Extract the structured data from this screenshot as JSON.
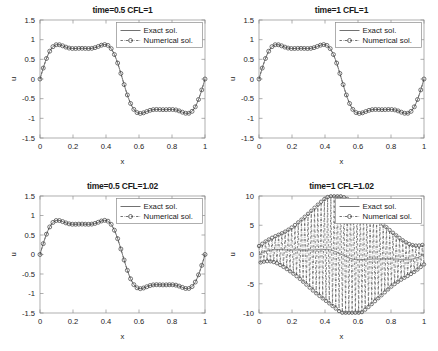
{
  "figure": {
    "background": "#ffffff",
    "axis_color": "#8c8c8c",
    "line_color": "#4d4d4d",
    "marker_color": "#3d3d3d",
    "text_color": "#1a1a1a",
    "rows": 2,
    "cols": 2
  },
  "legend": {
    "exact_label": "Exact sol.",
    "numerical_label": "Numerical sol.",
    "position": "top-right"
  },
  "chart_data": [
    {
      "id": "subplot-1",
      "type": "line",
      "title": "time=0.5 CFL=1",
      "xlabel": "x",
      "ylabel": "u",
      "xlim": [
        0,
        1
      ],
      "ylim": [
        -1.5,
        1.5
      ],
      "xticks": [
        0,
        0.2,
        0.4,
        0.6,
        0.8,
        1
      ],
      "xticklabels": [
        "0",
        "0.2",
        "0.4",
        "0.6",
        "0.8",
        "1"
      ],
      "yticks": [
        -1.5,
        -1,
        -0.5,
        0,
        0.5,
        1,
        1.5
      ],
      "yticklabels": [
        "-1.5",
        "-1",
        "-0.5",
        "0",
        "0.5",
        "1",
        "1.5"
      ],
      "grid": false,
      "waveform": {
        "formula": "sin(2*pi*x) + 0.3*sin(6*pi*x) + 0.08*sin(10*pi*x)",
        "amp1": 1.0,
        "freq1": 2,
        "amp2": 0.3,
        "freq2": 6,
        "amp3": 0.08,
        "freq3": 10,
        "phase": 0.0
      },
      "series": [
        {
          "name": "Exact sol.",
          "style": "solid",
          "marker": "none",
          "samples": 400
        },
        {
          "name": "Numerical sol.",
          "style": "dashdot",
          "marker": "circle",
          "samples": 51
        }
      ],
      "peak_value": 1.25,
      "trough_value": -1.25,
      "peak_x": 0.25,
      "trough_x": 0.75
    },
    {
      "id": "subplot-2",
      "type": "line",
      "title": "time=1 CFL=1",
      "xlabel": "x",
      "ylabel": "u",
      "xlim": [
        0,
        1
      ],
      "ylim": [
        -1.5,
        1.5
      ],
      "xticks": [
        0,
        0.2,
        0.4,
        0.6,
        0.8,
        1
      ],
      "xticklabels": [
        "0",
        "0.2",
        "0.4",
        "0.6",
        "0.8",
        "1"
      ],
      "yticks": [
        -1.5,
        -1,
        -0.5,
        0,
        0.5,
        1,
        1.5
      ],
      "yticklabels": [
        "-1.5",
        "-1",
        "-0.5",
        "0",
        "0.5",
        "1",
        "1.5"
      ],
      "grid": false,
      "waveform": {
        "formula": "sin(2*pi*x) + 0.3*sin(6*pi*x) + 0.08*sin(10*pi*x)",
        "amp1": 1.0,
        "freq1": 2,
        "amp2": 0.3,
        "freq2": 6,
        "amp3": 0.08,
        "freq3": 10,
        "phase": 0.0
      },
      "series": [
        {
          "name": "Exact sol.",
          "style": "solid",
          "marker": "none",
          "samples": 400
        },
        {
          "name": "Numerical sol.",
          "style": "dashdot",
          "marker": "circle",
          "samples": 51
        }
      ],
      "peak_value": 1.24,
      "trough_value": -1.24,
      "peak_x": 0.25,
      "trough_x": 0.75
    },
    {
      "id": "subplot-3",
      "type": "line",
      "title": "time=0.5 CFL=1.02",
      "xlabel": "x",
      "ylabel": "u",
      "xlim": [
        0,
        1
      ],
      "ylim": [
        -1.5,
        1.5
      ],
      "xticks": [
        0,
        0.2,
        0.4,
        0.6,
        0.8,
        1
      ],
      "xticklabels": [
        "0",
        "0.2",
        "0.4",
        "0.6",
        "0.8",
        "1"
      ],
      "yticks": [
        -1.5,
        -1,
        -0.5,
        0,
        0.5,
        1,
        1.5
      ],
      "yticklabels": [
        "-1.5",
        "-1",
        "-0.5",
        "0",
        "0.5",
        "1",
        "1.5"
      ],
      "grid": false,
      "waveform": {
        "formula": "sin(2*pi*x) + 0.3*sin(6*pi*x) + 0.08*sin(10*pi*x)",
        "amp1": 1.0,
        "freq1": 2,
        "amp2": 0.3,
        "freq2": 6,
        "amp3": 0.08,
        "freq3": 10,
        "phase": 0.0
      },
      "series": [
        {
          "name": "Exact sol.",
          "style": "solid",
          "marker": "none",
          "samples": 400
        },
        {
          "name": "Numerical sol.",
          "style": "dashdot",
          "marker": "circle",
          "samples": 51
        }
      ],
      "peak_value": 1.24,
      "trough_value": -1.26,
      "peak_x": 0.25,
      "trough_x": 0.75
    },
    {
      "id": "subplot-4",
      "type": "line",
      "title": "time=1 CFL=1.02",
      "xlabel": "x",
      "ylabel": "u",
      "xlim": [
        0,
        1
      ],
      "ylim": [
        -10,
        10
      ],
      "xticks": [
        0,
        0.2,
        0.4,
        0.6,
        0.8,
        1
      ],
      "xticklabels": [
        "0",
        "0.2",
        "0.4",
        "0.6",
        "0.8",
        "1"
      ],
      "yticks": [
        -10,
        -5,
        0,
        5,
        10
      ],
      "yticklabels": [
        "-10",
        "-5",
        "0",
        "5",
        "10"
      ],
      "grid": false,
      "waveform": {
        "formula": "sin(2*pi*x) + 0.3*sin(6*pi*x) + 0.08*sin(10*pi*x)",
        "amp1": 1.0,
        "freq1": 2,
        "amp2": 0.3,
        "freq2": 6,
        "amp3": 0.08,
        "freq3": 10,
        "phase": 0.0
      },
      "instability": {
        "present": true,
        "description": "sawtooth oscillation, alternating sign, envelope peaks near x=0.5",
        "envelope_max": 10.0,
        "envelope_min": 1.0,
        "envelope_center": 0.52,
        "node_count": 101
      },
      "series": [
        {
          "name": "Exact sol.",
          "style": "solid",
          "marker": "none",
          "samples": 400
        },
        {
          "name": "Numerical sol.",
          "style": "dashdot",
          "marker": "circle",
          "samples": 101
        }
      ],
      "peak_value": 9.9,
      "trough_value": -10.0
    }
  ]
}
